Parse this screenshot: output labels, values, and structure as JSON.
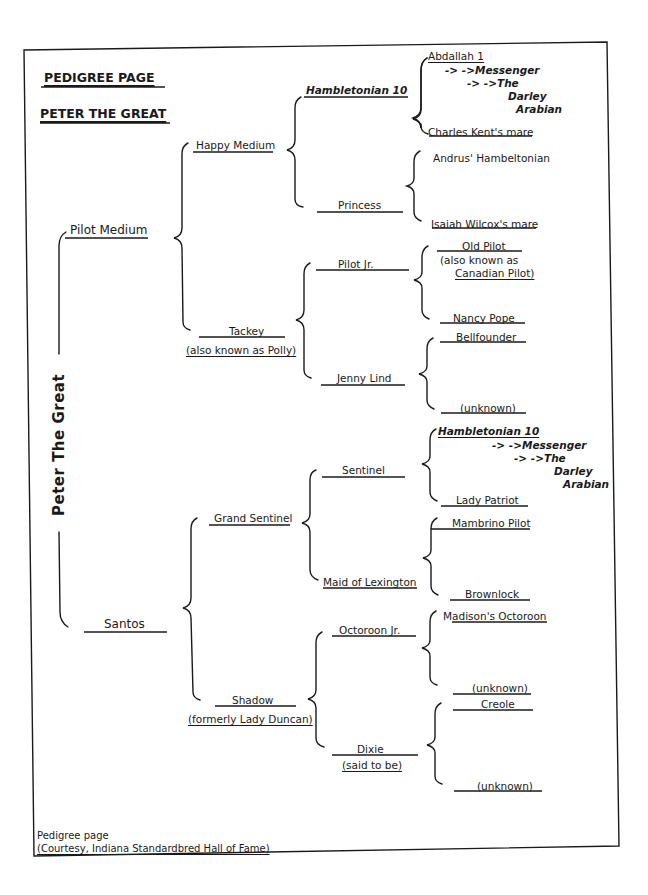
{
  "header": {
    "title": "PEDIGREE PAGE",
    "subject": "PETER THE GREAT"
  },
  "pedigree": {
    "subject": "Peter The Great",
    "sire": "Pilot Medium",
    "dam": "Santos",
    "sire_sire": "Happy Medium",
    "sire_dam": "Tackey",
    "sire_dam_note": "(also known as Polly)",
    "dam_sire": "Grand Sentinel",
    "dam_dam": "Shadow",
    "dam_dam_note": "(formerly Lady Duncan)",
    "gen3": {
      "hambletonian": "Hambletonian 10",
      "princess": "Princess",
      "pilot_jr": "Pilot Jr.",
      "jenny_lind": "Jenny Lind",
      "sentinel": "Sentinel",
      "maid_of_lexington": "Maid of Lexington",
      "octoroon_jr": "Octoroon Jr.",
      "dixie": "Dixie",
      "dixie_note": "(said to be)"
    },
    "gen4": {
      "abdallah": "Abdallah 1",
      "abdallah_line1": "-> ->Messenger",
      "abdallah_line2": "-> ->The",
      "abdallah_line3": "Darley",
      "abdallah_line4": "Arabian",
      "charles_kent": "Charles Kent's mare",
      "andrus": "Andrus' Hambeltonian",
      "isaiah": "Isaiah Wilcox's mare",
      "old_pilot": "Old Pilot",
      "old_pilot_note1": "(also known as",
      "old_pilot_note2": "Canadian Pilot)",
      "nancy_pope": "Nancy Pope",
      "bellfounder": "Bellfounder",
      "unknown1": "(unknown)",
      "hambletonian2": "Hambletonian 10",
      "ham2_line1": "-> ->Messenger",
      "ham2_line2": "-> ->The",
      "ham2_line3": "Darley",
      "ham2_line4": "Arabian",
      "lady_patriot": "Lady Patriot",
      "mambrino": "Mambrino Pilot",
      "brownlock": "Brownlock",
      "madison": "Madison's Octoroon",
      "unknown2": "(unknown)",
      "creole": "Creole",
      "unknown3": "(unknown)"
    }
  },
  "footer": {
    "caption": "Pedigree page",
    "credit": "(Courtesy, Indiana Standardbred Hall of Fame)"
  }
}
